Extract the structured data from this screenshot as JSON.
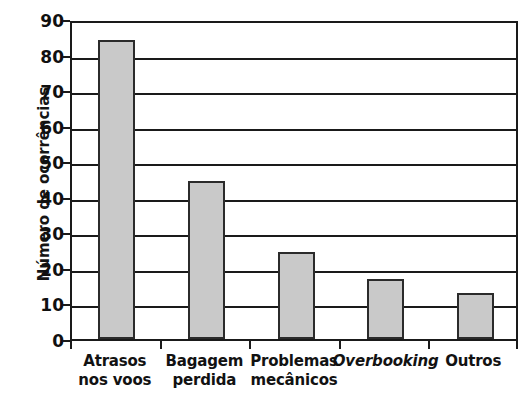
{
  "chart_data": {
    "type": "bar",
    "title": "",
    "xlabel": "",
    "ylabel": "Número de ocorrências",
    "categories": [
      "Atrasos nos voos",
      "Bagagem perdida",
      "Problemas mecânicos",
      "Overbooking",
      "Outros"
    ],
    "category_lines": [
      [
        "Atrasos",
        "nos voos"
      ],
      [
        "Bagagem",
        "perdida"
      ],
      [
        "Problemas",
        "mecânicos"
      ],
      [
        "Overbooking",
        ""
      ],
      [
        "Outros",
        ""
      ]
    ],
    "category_styles": [
      "normal",
      "normal",
      "normal",
      "italic",
      "normal"
    ],
    "values": [
      84,
      44.5,
      24.5,
      17,
      13
    ],
    "ylim": [
      0,
      90
    ],
    "ytick_step": 10,
    "yticks": [
      0,
      10,
      20,
      30,
      40,
      50,
      60,
      70,
      80,
      90
    ],
    "ytick_labels": [
      "0",
      "10",
      "20",
      "30",
      "40",
      "50",
      "60",
      "70",
      "80",
      "90"
    ],
    "grid": "horizontal",
    "legend": "none",
    "bar_fill_color": "#c9c9c9",
    "bar_edge_color": "#2b2b2b",
    "axis_color": "#1a1a1a",
    "background_color": "#ffffff"
  }
}
